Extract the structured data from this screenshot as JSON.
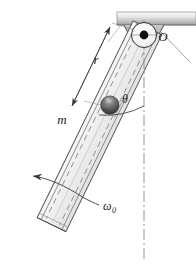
{
  "figure": {
    "labels": {
      "pivot": "O",
      "radius": "r",
      "mass": "m",
      "angle": "θ",
      "omega": "ω",
      "omega_subscript": "0"
    },
    "colors": {
      "outline": "#1a1a1a",
      "tube_fill": "#ececed",
      "tube_stroke": "#6b6b6b",
      "dash_line": "#8c8c8c",
      "ceiling_light": "#f2f2f2",
      "ceiling_dark": "#9a9a9a",
      "bracket_fill": "#b8b8b8",
      "ball_dark": "#4a4a4a",
      "ball_light": "#a8a8a8",
      "centerline": "#8a8a8a",
      "leader": "#555555"
    },
    "geometry": {
      "pivot_x": 144,
      "pivot_y": 35,
      "tilt_deg": 26,
      "tube_half_width": 16,
      "tube_length": 218,
      "mass_distance": 78,
      "ball_radius": 9,
      "ceiling_y": 14,
      "centerline_bottom": 258
    },
    "elements": [
      "ceiling-support",
      "pivot-bracket",
      "pivot-circle",
      "pivot-dot",
      "tube-body",
      "tube-slot-dashes",
      "mass-ball",
      "radius-dimension",
      "angle-arc",
      "vertical-centerline",
      "rotation-arrow"
    ]
  }
}
